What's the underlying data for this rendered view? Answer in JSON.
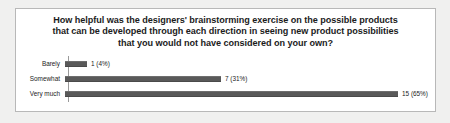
{
  "chart_data": {
    "type": "bar",
    "orientation": "horizontal",
    "title_lines": [
      "How helpful was the designers' brainstorming exercise on the possible products",
      "that can be developed through each direction in seeing new product possibilities",
      "that you would not have considered on your own?"
    ],
    "xlabel": "",
    "ylabel": "",
    "categories": [
      "Barely",
      "Somewhat",
      "Very much"
    ],
    "values": [
      1,
      7,
      15
    ],
    "percents": [
      4,
      31,
      65
    ],
    "data_labels": [
      "1 (4%)",
      "7 (31%)",
      "15 (65%)"
    ],
    "xlim": [
      0,
      15
    ],
    "grid": false,
    "legend": false,
    "bar_color": "#595959",
    "total_responses": 23,
    "rows": [
      {
        "category": "Barely",
        "value": 1,
        "percent": 4,
        "label": "1 (4%)",
        "bar_width_px": 22
      },
      {
        "category": "Somewhat",
        "value": 7,
        "percent": 31,
        "label": "7 (31%)",
        "bar_width_px": 156
      },
      {
        "category": "Very much",
        "value": 15,
        "percent": 65,
        "label": "15 (65%)",
        "bar_width_px": 333
      }
    ]
  },
  "colors": {
    "page_background": "#f0f0ef",
    "card_background": "#ffffff",
    "card_border": "#b8b8b8",
    "bar": "#595959",
    "axis": "#9a9a9a",
    "text": "#1b1b1b"
  }
}
